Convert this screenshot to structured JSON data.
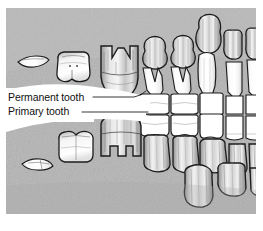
{
  "figure": {
    "panel": {
      "background_color": "#b4b4b4",
      "page_color": "#ffffff",
      "outline_color": "#1a1a1a",
      "x": 6,
      "y": 8,
      "width": 250,
      "height": 206
    },
    "callout": {
      "fill_color": "#ffffff",
      "leader_color": "#1a1a1a"
    }
  },
  "labels": [
    {
      "id": "permanent-tooth",
      "text": "Permanent tooth",
      "x": 8,
      "y": 101,
      "leader": "M 95,98 L 140,98 L 152,93"
    },
    {
      "id": "primary-tooth",
      "text": "Primary tooth",
      "x": 8,
      "y": 115,
      "leader": "M 84,112 L 148,112"
    }
  ],
  "tooth_fill": {
    "white": "#fcfcfc",
    "shaded_light": "#e8e8e8",
    "shaded_mid": "#c8c8c8",
    "shaded_dark": "#9a9a9a"
  },
  "teeth": {
    "upper_fragments": [
      {
        "id": "upper-fragment-left",
        "name": "bone-fragment"
      }
    ],
    "upper_white_molars": [
      {
        "id": "upper-molar-1",
        "name": "primary-molar-crown"
      },
      {
        "id": "upper-molar-2",
        "name": "primary-molar-crown"
      }
    ],
    "upper_developing_crowns": [
      {
        "id": "upper-crown-1",
        "name": "permanent-premolar-crown"
      },
      {
        "id": "upper-crown-2",
        "name": "permanent-premolar-crown"
      },
      {
        "id": "upper-crown-3",
        "name": "permanent-canine-crown"
      },
      {
        "id": "upper-crown-4",
        "name": "permanent-incisor-crown"
      },
      {
        "id": "upper-crown-5",
        "name": "permanent-incisor-crown"
      }
    ],
    "occlusal_row": [
      {
        "id": "occlusal-1",
        "name": "primary-tooth-erupted"
      },
      {
        "id": "occlusal-2",
        "name": "primary-tooth-erupted"
      },
      {
        "id": "occlusal-3",
        "name": "primary-tooth-erupted"
      },
      {
        "id": "occlusal-4",
        "name": "primary-tooth-erupted"
      },
      {
        "id": "occlusal-5",
        "name": "primary-tooth-erupted"
      }
    ],
    "lower_white_molars": [
      {
        "id": "lower-molar-1",
        "name": "primary-molar-crown"
      },
      {
        "id": "lower-molar-2",
        "name": "primary-molar-crown"
      }
    ],
    "lower_developing_crowns": [
      {
        "id": "lower-crown-1",
        "name": "permanent-premolar-crown"
      },
      {
        "id": "lower-crown-2",
        "name": "permanent-premolar-crown"
      },
      {
        "id": "lower-crown-3",
        "name": "permanent-canine-crown"
      },
      {
        "id": "lower-crown-4",
        "name": "permanent-incisor-crown"
      },
      {
        "id": "lower-crown-5",
        "name": "permanent-incisor-crown"
      }
    ],
    "lower_fragments": [
      {
        "id": "lower-fragment-left",
        "name": "bone-fragment"
      }
    ]
  }
}
